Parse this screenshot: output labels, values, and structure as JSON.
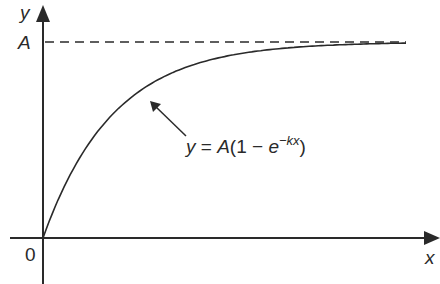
{
  "chart_data": {
    "type": "line",
    "title": "",
    "xlabel": "x",
    "ylabel": "y",
    "origin_label": "0",
    "asymptote_label": "A",
    "equation": "y = A(1 − e^(−kx))",
    "series": [
      {
        "name": "y = A(1 - e^(-kx))",
        "x": [
          0,
          0.5,
          1,
          1.5,
          2,
          3,
          4,
          5,
          6
        ],
        "values": [
          0,
          0.39,
          0.63,
          0.78,
          0.86,
          0.95,
          0.98,
          0.99,
          1.0
        ]
      }
    ],
    "asymptote": {
      "y": "A",
      "style": "dashed"
    },
    "grid": false,
    "legend": "none"
  },
  "labels": {
    "y_axis": "y",
    "x_axis": "x",
    "origin": "0",
    "asymptote": "A",
    "eq_y": "y",
    "eq_eq": " = ",
    "eq_A": "A",
    "eq_open": "(1 − ",
    "eq_e": "e",
    "eq_exp": "−kx",
    "eq_close": ")"
  },
  "colors": {
    "ink": "#2a2a2a",
    "background": "#ffffff"
  }
}
